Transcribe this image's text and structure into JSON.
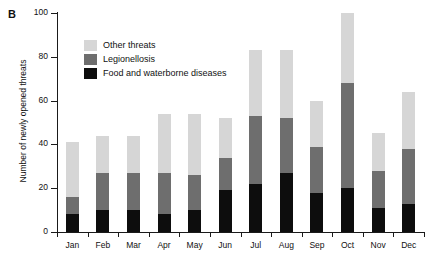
{
  "panel": {
    "label": "B"
  },
  "axes": {
    "ylabel": "Number of newly opened threats",
    "yticks": [
      "0",
      "20",
      "40",
      "60",
      "80",
      "100"
    ],
    "ytick_values": [
      0,
      20,
      40,
      60,
      80,
      100
    ],
    "xlabel": ""
  },
  "legend": {
    "position": "top-left-inside",
    "items": [
      {
        "label": "Other threats",
        "color": "#d6d6d6",
        "swatch_name": "legend-swatch-other-threats"
      },
      {
        "label": "Legionellosis",
        "color": "#6e6e6e",
        "swatch_name": "legend-swatch-legionellosis"
      },
      {
        "label": "Food and waterborne diseases",
        "color": "#0d0d0d",
        "swatch_name": "legend-swatch-food-waterborne"
      }
    ]
  },
  "chart_data": {
    "type": "bar",
    "subtype": "stacked-vertical",
    "title": "",
    "xlabel": "",
    "ylabel": "Number of newly opened threats",
    "ylim": [
      0,
      100
    ],
    "yticks": [
      0,
      20,
      40,
      60,
      80,
      100
    ],
    "grid": false,
    "categories": [
      "Jan",
      "Feb",
      "Mar",
      "Apr",
      "May",
      "Jun",
      "Jul",
      "Aug",
      "Sep",
      "Oct",
      "Nov",
      "Dec"
    ],
    "series": [
      {
        "name": "Food and waterborne diseases",
        "color": "#0d0d0d",
        "values": [
          8,
          10,
          10,
          8,
          10,
          19,
          22,
          27,
          18,
          20,
          11,
          13
        ]
      },
      {
        "name": "Legionellosis",
        "color": "#6e6e6e",
        "values": [
          8,
          17,
          17,
          19,
          16,
          15,
          31,
          25,
          21,
          48,
          17,
          25
        ]
      },
      {
        "name": "Other threats",
        "color": "#d6d6d6",
        "values": [
          25,
          17,
          17,
          27,
          28,
          18,
          30,
          31,
          21,
          32,
          17,
          26
        ]
      }
    ],
    "totals": [
      41,
      44,
      44,
      54,
      54,
      52,
      83,
      83,
      60,
      100,
      45,
      64
    ],
    "legend_position": "upper left inside axes"
  }
}
